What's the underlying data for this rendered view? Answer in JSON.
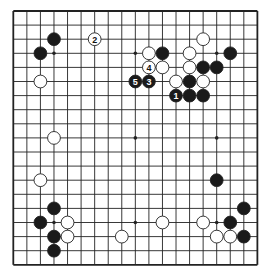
{
  "diagram": {
    "type": "go-board",
    "size": 19,
    "colors": {
      "background": "#ffffff",
      "line": "#222222",
      "black_stone": "#1a1a1a",
      "white_stone": "#ffffff",
      "stone_outline": "#222222"
    },
    "hoshi": [
      [
        3,
        3
      ],
      [
        9,
        3
      ],
      [
        15,
        3
      ],
      [
        3,
        9
      ],
      [
        9,
        9
      ],
      [
        15,
        9
      ],
      [
        3,
        15
      ],
      [
        9,
        15
      ],
      [
        15,
        15
      ]
    ],
    "stones": [
      {
        "color": "black",
        "col": 3,
        "row": 2,
        "label": ""
      },
      {
        "color": "black",
        "col": 2,
        "row": 3,
        "label": ""
      },
      {
        "color": "white",
        "col": 6,
        "row": 2,
        "label": "2"
      },
      {
        "color": "white",
        "col": 2,
        "row": 5,
        "label": ""
      },
      {
        "color": "white",
        "col": 10,
        "row": 3,
        "label": ""
      },
      {
        "color": "black",
        "col": 11,
        "row": 3,
        "label": ""
      },
      {
        "color": "white",
        "col": 13,
        "row": 3,
        "label": ""
      },
      {
        "color": "white",
        "col": 14,
        "row": 2,
        "label": ""
      },
      {
        "color": "black",
        "col": 16,
        "row": 3,
        "label": ""
      },
      {
        "color": "white",
        "col": 10,
        "row": 4,
        "label": "4"
      },
      {
        "color": "white",
        "col": 11,
        "row": 4,
        "label": ""
      },
      {
        "color": "white",
        "col": 13,
        "row": 4,
        "label": ""
      },
      {
        "color": "black",
        "col": 14,
        "row": 4,
        "label": ""
      },
      {
        "color": "black",
        "col": 15,
        "row": 4,
        "label": ""
      },
      {
        "color": "black",
        "col": 9,
        "row": 5,
        "label": "5"
      },
      {
        "color": "black",
        "col": 10,
        "row": 5,
        "label": "3"
      },
      {
        "color": "white",
        "col": 12,
        "row": 5,
        "label": ""
      },
      {
        "color": "black",
        "col": 13,
        "row": 5,
        "label": ""
      },
      {
        "color": "white",
        "col": 14,
        "row": 5,
        "label": ""
      },
      {
        "color": "black",
        "col": 12,
        "row": 6,
        "label": "1"
      },
      {
        "color": "black",
        "col": 13,
        "row": 6,
        "label": ""
      },
      {
        "color": "black",
        "col": 14,
        "row": 6,
        "label": ""
      },
      {
        "color": "white",
        "col": 3,
        "row": 9,
        "label": ""
      },
      {
        "color": "white",
        "col": 2,
        "row": 12,
        "label": ""
      },
      {
        "color": "black",
        "col": 15,
        "row": 12,
        "label": ""
      },
      {
        "color": "black",
        "col": 3,
        "row": 14,
        "label": ""
      },
      {
        "color": "black",
        "col": 17,
        "row": 14,
        "label": ""
      },
      {
        "color": "black",
        "col": 2,
        "row": 15,
        "label": ""
      },
      {
        "color": "white",
        "col": 4,
        "row": 15,
        "label": ""
      },
      {
        "color": "white",
        "col": 11,
        "row": 15,
        "label": ""
      },
      {
        "color": "white",
        "col": 14,
        "row": 15,
        "label": ""
      },
      {
        "color": "black",
        "col": 16,
        "row": 15,
        "label": ""
      },
      {
        "color": "black",
        "col": 3,
        "row": 16,
        "label": ""
      },
      {
        "color": "white",
        "col": 4,
        "row": 16,
        "label": ""
      },
      {
        "color": "white",
        "col": 8,
        "row": 16,
        "label": ""
      },
      {
        "color": "white",
        "col": 15,
        "row": 16,
        "label": ""
      },
      {
        "color": "white",
        "col": 16,
        "row": 16,
        "label": ""
      },
      {
        "color": "black",
        "col": 17,
        "row": 16,
        "label": ""
      },
      {
        "color": "black",
        "col": 3,
        "row": 17,
        "label": ""
      }
    ]
  }
}
